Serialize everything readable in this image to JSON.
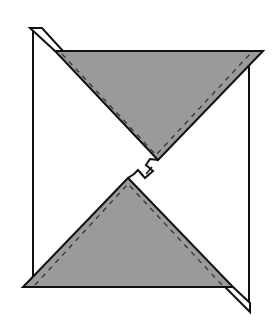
{
  "diagram": {
    "colors": {
      "background": "#ffffff",
      "outline": "#111111",
      "flap_fill": "#9a9a9a",
      "dashed_line": "#333333"
    },
    "labels": []
  }
}
